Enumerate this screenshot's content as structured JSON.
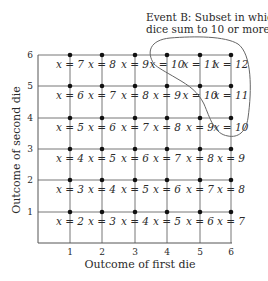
{
  "title": {
    "line1": "Event  B: Subset in which",
    "line2": "dice sum to 10 or more"
  },
  "axes": {
    "x_label": "Outcome of first die",
    "y_label": "Outcome of second die",
    "x_ticks": [
      "1",
      "2",
      "3",
      "4",
      "5",
      "6"
    ],
    "y_ticks": [
      "1",
      "2",
      "3",
      "4",
      "5",
      "6"
    ]
  },
  "grid": {
    "rows": [
      {
        "die2": 6,
        "labels": [
          "x = 7",
          "x = 8",
          "x = 9",
          "x = 10",
          "x = 11",
          "x = 12"
        ]
      },
      {
        "die2": 5,
        "labels": [
          "x = 6",
          "x = 7",
          "x = 8",
          "x = 9",
          "x = 10",
          "x = 11"
        ]
      },
      {
        "die2": 4,
        "labels": [
          "x = 5",
          "x = 6",
          "x = 7",
          "x = 8",
          "x = 9",
          "x = 10"
        ]
      },
      {
        "die2": 3,
        "labels": [
          "x = 4",
          "x = 5",
          "x = 6",
          "x = 7",
          "x = 8",
          "x = 9"
        ]
      },
      {
        "die2": 2,
        "labels": [
          "x = 3",
          "x = 4",
          "x = 5",
          "x = 6",
          "x = 7",
          "x = 8"
        ]
      },
      {
        "die2": 1,
        "labels": [
          "x = 2",
          "x = 3",
          "x = 4",
          "x = 5",
          "x = 6",
          "x = 7"
        ]
      }
    ]
  },
  "colors": {
    "ink": "#2a2a2a",
    "line": "#555555",
    "dot": "#111111"
  }
}
